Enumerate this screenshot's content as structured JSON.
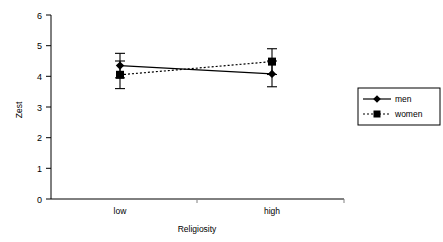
{
  "chart_data": {
    "type": "line",
    "title": "",
    "xlabel": "Religiosity",
    "ylabel": "Zest",
    "categories": [
      "low",
      "high"
    ],
    "x": [
      0,
      1
    ],
    "ylim": [
      0,
      6
    ],
    "yticks": [
      0,
      1,
      2,
      3,
      4,
      5,
      6
    ],
    "ytick_labels": [
      "0",
      "1",
      "2",
      "3",
      "4",
      "5",
      "6"
    ],
    "grid": false,
    "legend_position": "right",
    "series": [
      {
        "name": "men",
        "values": [
          4.35,
          4.08
        ],
        "errors": [
          0.4,
          0.42
        ],
        "error_low": [
          3.95,
          3.66
        ],
        "error_high": [
          4.75,
          4.5
        ],
        "marker": "diamond",
        "linestyle": "solid",
        "color": "#000000"
      },
      {
        "name": "women",
        "values": [
          4.05,
          4.48
        ],
        "errors": [
          0.45,
          0.42
        ],
        "error_low": [
          3.6,
          4.06
        ],
        "error_high": [
          4.5,
          4.9
        ],
        "marker": "square",
        "linestyle": "dotted",
        "color": "#000000"
      }
    ]
  },
  "axes": {
    "y_title": "Zest",
    "x_title": "Religiosity",
    "y_ticks": [
      "6",
      "5",
      "4",
      "3",
      "2",
      "1",
      "0"
    ],
    "x_categories": [
      "low",
      "high"
    ]
  },
  "legend": {
    "entries": [
      {
        "label": "men",
        "marker": "diamond",
        "linestyle": "solid"
      },
      {
        "label": "women",
        "marker": "square",
        "linestyle": "dotted"
      }
    ]
  },
  "colors": {
    "axis": "#000000",
    "series": "#000000",
    "background": "#ffffff",
    "legend_border": "#000000"
  }
}
